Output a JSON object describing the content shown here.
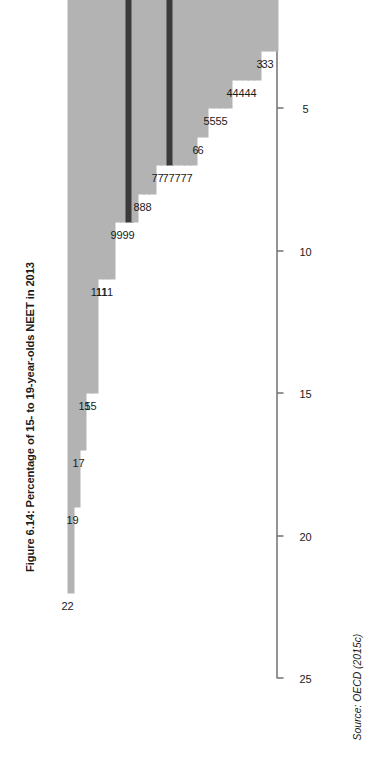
{
  "figure": {
    "title": "Figure 6.14: Percentage of 15- to 19-year-olds NEET in 2013",
    "source": "Source: OECD (2015c)"
  },
  "colors": {
    "bar": "#b3b3b3",
    "bar_highlight": "#3a3a3a",
    "axis": "#2b2b2b",
    "text": "#1a1a1a",
    "background": "#ffffff"
  },
  "chart_data": {
    "type": "bar",
    "orientation": "vertical-rotated",
    "title": "Figure 6.14: Percentage of 15- to 19-year-olds NEET in 2013",
    "xlabel": "",
    "ylabel": "",
    "ylim": [
      0,
      25
    ],
    "yticks": [
      0,
      5,
      10,
      15,
      20,
      25
    ],
    "grid": false,
    "legend": null,
    "highlighted": [
      "UK",
      "OECD average"
    ],
    "categories": [
      "Turkey",
      "Colombia",
      "Chile",
      "Mexico",
      "Brazil",
      "Italy",
      "Spain",
      "Ireland",
      "Greece",
      "Israel",
      "UK",
      "Korea",
      "US",
      "France",
      "New Zealand",
      "Australia",
      "Japan",
      "OECD average",
      "Portugal",
      "Iceland",
      "Belgium",
      "Canada",
      "Hungary",
      "Austria",
      "Slovak Republic",
      "Finland",
      "Estonia",
      "Denmark",
      "Netherlands",
      "Sweden",
      "Norway",
      "Slovenia",
      "Luxembourg",
      "Poland",
      "Czech Republic",
      "Germany"
    ],
    "values": [
      22,
      19,
      17,
      15,
      15,
      11,
      11,
      11,
      9,
      9,
      9,
      9,
      8,
      8,
      8,
      7,
      7,
      7,
      7,
      7,
      7,
      7,
      6,
      6,
      5,
      5,
      5,
      5,
      4,
      4,
      4,
      4,
      4,
      3,
      3,
      3
    ]
  }
}
